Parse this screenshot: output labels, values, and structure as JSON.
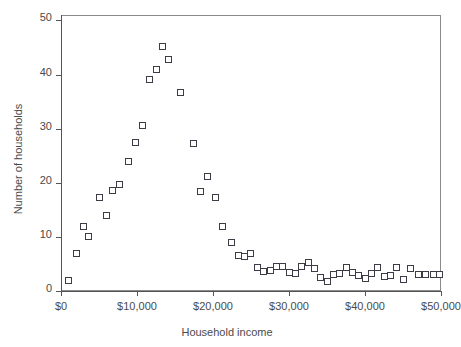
{
  "chart_data": {
    "type": "scatter",
    "title": "",
    "xlabel": "Household income",
    "ylabel": "Number of households",
    "xlim": [
      0,
      50000
    ],
    "ylim": [
      0,
      51
    ],
    "grid": false,
    "legend": null,
    "marker": "open-square",
    "marker_color": "#3c3c46",
    "axis_color": "#555555",
    "xticks": [
      0,
      10000,
      20000,
      30000,
      40000,
      50000
    ],
    "xticklabels": [
      "$0",
      "$10,000",
      "$20,000",
      "$30,000",
      "$40,000",
      "$50,000"
    ],
    "yticks": [
      0,
      10,
      20,
      30,
      40,
      50
    ],
    "yticklabels": [
      "0",
      "10",
      "20",
      "30",
      "40",
      "50"
    ],
    "points": [
      {
        "x": 1000,
        "y": 2
      },
      {
        "x": 2000,
        "y": 7
      },
      {
        "x": 3000,
        "y": 12
      },
      {
        "x": 3600,
        "y": 10
      },
      {
        "x": 5000,
        "y": 17.3
      },
      {
        "x": 6000,
        "y": 14
      },
      {
        "x": 6800,
        "y": 18.5
      },
      {
        "x": 7700,
        "y": 19.7
      },
      {
        "x": 8900,
        "y": 24
      },
      {
        "x": 9800,
        "y": 27.4
      },
      {
        "x": 10700,
        "y": 30.6
      },
      {
        "x": 11600,
        "y": 39
      },
      {
        "x": 12500,
        "y": 41
      },
      {
        "x": 13300,
        "y": 45.2
      },
      {
        "x": 14200,
        "y": 42.8
      },
      {
        "x": 15700,
        "y": 36.7
      },
      {
        "x": 17400,
        "y": 27.3
      },
      {
        "x": 18400,
        "y": 18.3
      },
      {
        "x": 19300,
        "y": 21.2
      },
      {
        "x": 20300,
        "y": 17.2
      },
      {
        "x": 21300,
        "y": 11.9
      },
      {
        "x": 22400,
        "y": 9
      },
      {
        "x": 23300,
        "y": 6.6
      },
      {
        "x": 24100,
        "y": 6.4
      },
      {
        "x": 24900,
        "y": 6.9
      },
      {
        "x": 25900,
        "y": 4.3
      },
      {
        "x": 26700,
        "y": 3.6
      },
      {
        "x": 27500,
        "y": 3.7
      },
      {
        "x": 28400,
        "y": 4.5
      },
      {
        "x": 29200,
        "y": 4.6
      },
      {
        "x": 30000,
        "y": 3.4
      },
      {
        "x": 30800,
        "y": 3.2
      },
      {
        "x": 31700,
        "y": 4.6
      },
      {
        "x": 32500,
        "y": 5.2
      },
      {
        "x": 33300,
        "y": 4.2
      },
      {
        "x": 34200,
        "y": 2.5
      },
      {
        "x": 35000,
        "y": 1.8
      },
      {
        "x": 35800,
        "y": 3.1
      },
      {
        "x": 36700,
        "y": 3.2
      },
      {
        "x": 37500,
        "y": 4.3
      },
      {
        "x": 38400,
        "y": 3.4
      },
      {
        "x": 39200,
        "y": 2.9
      },
      {
        "x": 40000,
        "y": 2.3
      },
      {
        "x": 40800,
        "y": 3.3
      },
      {
        "x": 41700,
        "y": 4.3
      },
      {
        "x": 42500,
        "y": 2.6
      },
      {
        "x": 43300,
        "y": 2.8
      },
      {
        "x": 44200,
        "y": 4.3
      },
      {
        "x": 45000,
        "y": 2.1
      },
      {
        "x": 46000,
        "y": 4.1
      },
      {
        "x": 47000,
        "y": 3.1
      },
      {
        "x": 48000,
        "y": 3.0
      },
      {
        "x": 49000,
        "y": 3.1
      },
      {
        "x": 49800,
        "y": 3.1
      }
    ]
  }
}
